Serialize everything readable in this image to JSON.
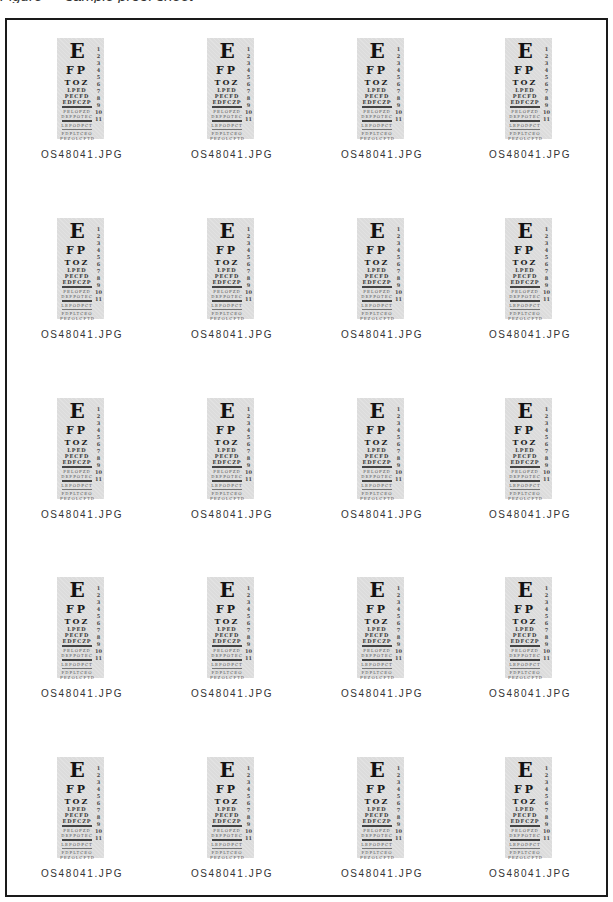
{
  "caption": "Figure — sample proof sheet",
  "sheet": {
    "columns": 4,
    "rows": 5,
    "thumbnail": {
      "type": "eye-chart",
      "rows": [
        "E",
        "FP",
        "TOZ",
        "LPED",
        "PECFD",
        "EDFCZP",
        "FELOPZD",
        "DEFPOTEC",
        "LEFODPCT",
        "FDPLTCEO",
        "PEZOLCFTD"
      ],
      "line_numbers": [
        "1",
        "2",
        "3",
        "4",
        "5",
        "6",
        "7",
        "8",
        "9",
        "10",
        "11"
      ]
    },
    "items": [
      {
        "label": "OS48041.JPG"
      },
      {
        "label": "OS48041.JPG"
      },
      {
        "label": "OS48041.JPG"
      },
      {
        "label": "OS48041.JPG"
      },
      {
        "label": "OS48041.JPG"
      },
      {
        "label": "OS48041.JPG"
      },
      {
        "label": "OS48041.JPG"
      },
      {
        "label": "OS48041.JPG"
      },
      {
        "label": "OS48041.JPG"
      },
      {
        "label": "OS48041.JPG"
      },
      {
        "label": "OS48041.JPG"
      },
      {
        "label": "OS48041.JPG"
      },
      {
        "label": "OS48041.JPG"
      },
      {
        "label": "OS48041.JPG"
      },
      {
        "label": "OS48041.JPG"
      },
      {
        "label": "OS48041.JPG"
      },
      {
        "label": "OS48041.JPG"
      },
      {
        "label": "OS48041.JPG"
      },
      {
        "label": "OS48041.JPG"
      },
      {
        "label": "OS48041.JPG"
      }
    ]
  }
}
